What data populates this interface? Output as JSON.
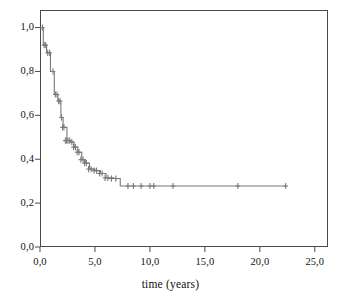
{
  "figure": {
    "background_color": "#ffffff",
    "frame_color": "#4a4a4a",
    "curve_color": "#7a7a7a",
    "tick_color": "#4a4a4a",
    "text_color": "#111111"
  },
  "axes": {
    "x_title": "time (years)",
    "y_title": "",
    "x_tick_labels": [
      "0,0",
      "5,0",
      "10,0",
      "15,0",
      "20,0",
      "25,0"
    ],
    "y_tick_labels": [
      "0,0",
      "0,2",
      "0,4",
      "0,6",
      "0,8",
      "1,0"
    ]
  },
  "chart_data": {
    "type": "line",
    "title": "",
    "subtitle": "",
    "xlabel": "time (years)",
    "ylabel": "",
    "xlim": [
      0,
      26.2
    ],
    "ylim": [
      0,
      1.08
    ],
    "x_ticks": [
      0,
      5,
      10,
      15,
      20,
      25
    ],
    "y_ticks": [
      0,
      0.2,
      0.4,
      0.6,
      0.8,
      1.0
    ],
    "grid": false,
    "legend": false,
    "legend_position": "none",
    "curve_style": "step",
    "series": [
      {
        "name": "survival",
        "x": [
          0.0,
          0.18,
          0.3,
          0.3,
          0.45,
          0.6,
          0.6,
          0.78,
          0.95,
          0.95,
          1.1,
          1.3,
          1.3,
          1.5,
          1.62,
          1.62,
          1.75,
          1.9,
          1.9,
          2.0,
          2.1,
          2.1,
          2.3,
          2.45,
          2.45,
          2.62,
          2.8,
          2.8,
          3.0,
          3.1,
          3.1,
          3.3,
          3.45,
          3.45,
          3.62,
          3.8,
          3.8,
          4.0,
          4.12,
          4.12,
          4.3,
          4.5,
          4.5,
          4.8,
          5.0,
          5.0,
          5.3,
          5.5,
          5.5,
          5.8,
          6.0,
          6.0,
          6.35,
          6.7,
          6.7,
          7.1,
          7.3,
          7.3,
          22.4
        ],
        "y": [
          1.0,
          1.0,
          1.0,
          0.92,
          0.92,
          0.92,
          0.885,
          0.885,
          0.885,
          0.8,
          0.8,
          0.8,
          0.695,
          0.695,
          0.695,
          0.665,
          0.665,
          0.665,
          0.59,
          0.59,
          0.59,
          0.545,
          0.545,
          0.545,
          0.485,
          0.485,
          0.485,
          0.478,
          0.478,
          0.478,
          0.455,
          0.455,
          0.455,
          0.432,
          0.432,
          0.432,
          0.398,
          0.398,
          0.398,
          0.382,
          0.382,
          0.382,
          0.355,
          0.355,
          0.355,
          0.348,
          0.348,
          0.348,
          0.335,
          0.335,
          0.335,
          0.315,
          0.315,
          0.315,
          0.312,
          0.312,
          0.312,
          0.278,
          0.278
        ]
      }
    ],
    "censor_marks": {
      "description": "plus-shaped censoring tick marks on the survival curve",
      "points": [
        {
          "x": 0.22,
          "y": 1.0
        },
        {
          "x": 0.38,
          "y": 0.92
        },
        {
          "x": 0.52,
          "y": 0.92
        },
        {
          "x": 0.7,
          "y": 0.885
        },
        {
          "x": 0.88,
          "y": 0.885
        },
        {
          "x": 1.18,
          "y": 0.8
        },
        {
          "x": 1.4,
          "y": 0.695
        },
        {
          "x": 1.55,
          "y": 0.695
        },
        {
          "x": 1.7,
          "y": 0.665
        },
        {
          "x": 1.82,
          "y": 0.665
        },
        {
          "x": 1.96,
          "y": 0.59
        },
        {
          "x": 2.05,
          "y": 0.545
        },
        {
          "x": 2.18,
          "y": 0.545
        },
        {
          "x": 2.3,
          "y": 0.485
        },
        {
          "x": 2.42,
          "y": 0.485
        },
        {
          "x": 2.55,
          "y": 0.485
        },
        {
          "x": 2.7,
          "y": 0.485
        },
        {
          "x": 2.9,
          "y": 0.478
        },
        {
          "x": 3.05,
          "y": 0.455
        },
        {
          "x": 3.22,
          "y": 0.455
        },
        {
          "x": 3.38,
          "y": 0.432
        },
        {
          "x": 3.55,
          "y": 0.432
        },
        {
          "x": 3.72,
          "y": 0.398
        },
        {
          "x": 3.92,
          "y": 0.398
        },
        {
          "x": 4.05,
          "y": 0.382
        },
        {
          "x": 4.22,
          "y": 0.382
        },
        {
          "x": 4.42,
          "y": 0.355
        },
        {
          "x": 4.65,
          "y": 0.355
        },
        {
          "x": 4.92,
          "y": 0.348
        },
        {
          "x": 5.15,
          "y": 0.348
        },
        {
          "x": 5.42,
          "y": 0.335
        },
        {
          "x": 5.65,
          "y": 0.335
        },
        {
          "x": 5.92,
          "y": 0.315
        },
        {
          "x": 6.18,
          "y": 0.315
        },
        {
          "x": 6.5,
          "y": 0.312
        },
        {
          "x": 6.9,
          "y": 0.312
        },
        {
          "x": 8.0,
          "y": 0.278
        },
        {
          "x": 8.5,
          "y": 0.278
        },
        {
          "x": 9.2,
          "y": 0.278
        },
        {
          "x": 10.0,
          "y": 0.278
        },
        {
          "x": 10.35,
          "y": 0.278
        },
        {
          "x": 12.1,
          "y": 0.278
        },
        {
          "x": 18.0,
          "y": 0.278
        },
        {
          "x": 22.35,
          "y": 0.278
        }
      ]
    }
  }
}
